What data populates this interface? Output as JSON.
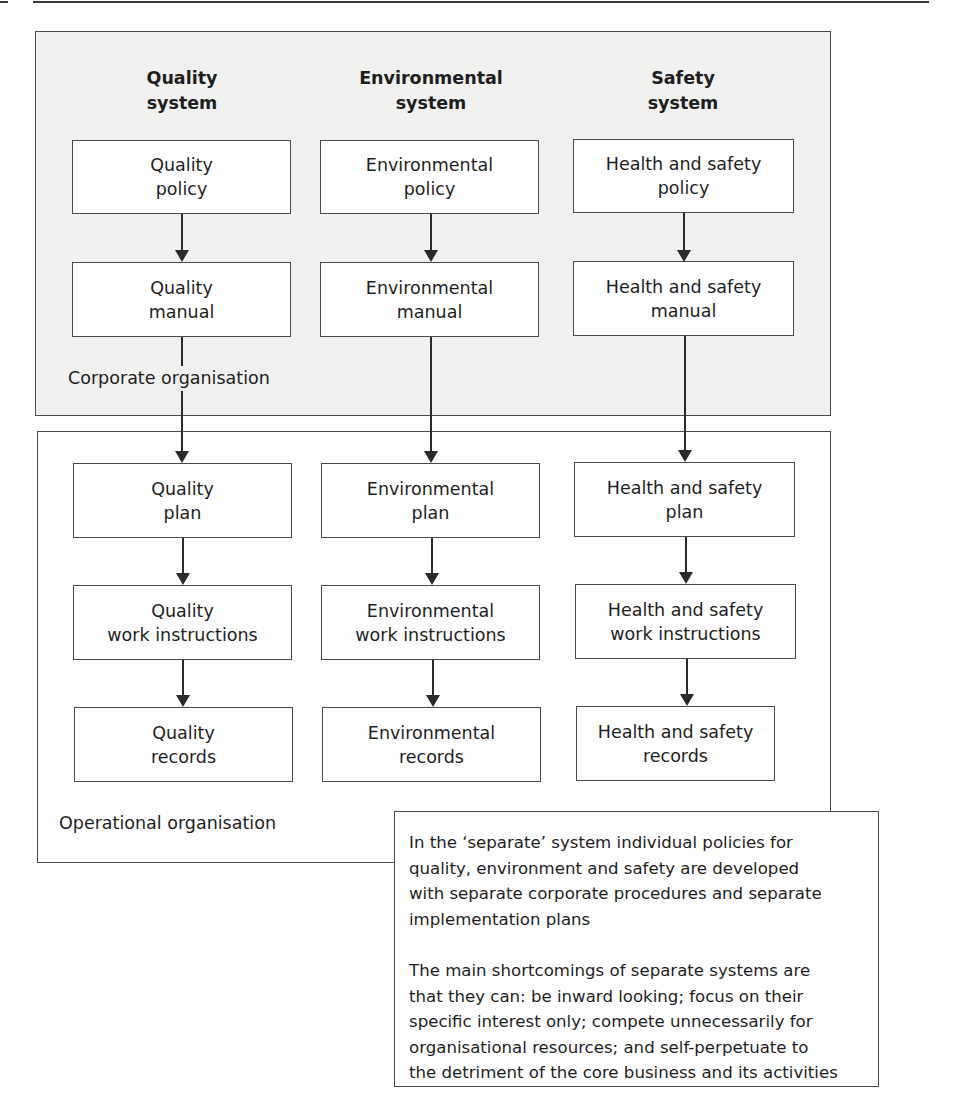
{
  "page": {
    "top_rule": true
  },
  "regions": {
    "corporate": {
      "label": "Corporate organisation",
      "fill": "#f1f1f0"
    },
    "operational": {
      "label": "Operational organisation",
      "fill": "#ffffff"
    }
  },
  "columns": [
    {
      "header": [
        "Quality",
        "system"
      ],
      "nodes": {
        "policy": [
          "Quality",
          "policy"
        ],
        "manual": [
          "Quality",
          "manual"
        ],
        "plan": [
          "Quality",
          "plan"
        ],
        "work_instructions": [
          "Quality",
          "work instructions"
        ],
        "records": [
          "Quality",
          "records"
        ]
      }
    },
    {
      "header": [
        "Environmental",
        "system"
      ],
      "nodes": {
        "policy": [
          "Environmental",
          "policy"
        ],
        "manual": [
          "Environmental",
          "manual"
        ],
        "plan": [
          "Environmental",
          "plan"
        ],
        "work_instructions": [
          "Environmental",
          "work instructions"
        ],
        "records": [
          "Environmental",
          "records"
        ]
      }
    },
    {
      "header": [
        "Safety",
        "system"
      ],
      "nodes": {
        "policy": [
          "Health and safety",
          "policy"
        ],
        "manual": [
          "Health and safety",
          "manual"
        ],
        "plan": [
          "Health and safety",
          "plan"
        ],
        "work_instructions": [
          "Health and safety",
          "work instructions"
        ],
        "records": [
          "Health and safety",
          "records"
        ]
      }
    }
  ],
  "flow": [
    "policy",
    "manual",
    "plan",
    "work_instructions",
    "records"
  ],
  "note": {
    "paragraphs": [
      "In the ‘separate’ system individual policies for quality, environment and safety are developed with separate corporate procedures and separate implementation plans",
      "The main shortcomings of separate systems are that they can: be inward looking; focus on their specific interest only; compete unnecessarily for organisational resources; and self-perpetuate to the detriment of the core business and its activities"
    ],
    "lines": [
      [
        "In the ‘separate’ system individual policies for",
        "quality, environment and safety are developed",
        "with separate corporate procedures and separate",
        "implementation plans"
      ],
      [
        "The main shortcomings of separate systems are",
        "that they can: be inward looking; focus on their",
        "specific interest only; compete unnecessarily for",
        "organisational resources; and self-perpetuate to",
        "the detriment of the core business and its activities"
      ]
    ]
  }
}
